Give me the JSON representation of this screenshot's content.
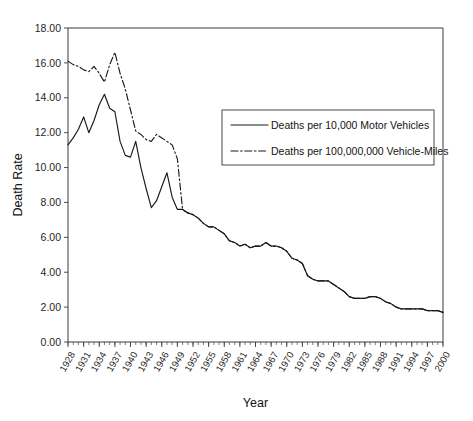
{
  "chart_data": {
    "type": "line",
    "title": "",
    "xlabel": "Year",
    "ylabel": "Death Rate",
    "ylim": [
      0,
      18
    ],
    "ytick_labels": [
      "0.00",
      "2.00",
      "4.00",
      "6.00",
      "8.00",
      "10.00",
      "12.00",
      "14.00",
      "16.00",
      "18.00"
    ],
    "ytick_values": [
      0,
      2,
      4,
      6,
      8,
      10,
      12,
      14,
      16,
      18
    ],
    "grid": false,
    "legend_position": "upper-right-inside",
    "xlim": [
      1928,
      2000
    ],
    "xtick_labels": [
      "1928",
      "1931",
      "1934",
      "1937",
      "1940",
      "1943",
      "1946",
      "1949",
      "1952",
      "1955",
      "1958",
      "1961",
      "1964",
      "1967",
      "1970",
      "1973",
      "1976",
      "1979",
      "1982",
      "1985",
      "1988",
      "1991",
      "1994",
      "1997",
      "2000"
    ],
    "xtick_values": [
      1928,
      1931,
      1934,
      1937,
      1940,
      1943,
      1946,
      1949,
      1952,
      1955,
      1958,
      1961,
      1964,
      1967,
      1970,
      1973,
      1976,
      1979,
      1982,
      1985,
      1988,
      1991,
      1994,
      1997,
      2000
    ],
    "x": [
      1928,
      1929,
      1930,
      1931,
      1932,
      1933,
      1934,
      1935,
      1936,
      1937,
      1938,
      1939,
      1940,
      1941,
      1942,
      1943,
      1944,
      1945,
      1946,
      1947,
      1948,
      1949,
      1950,
      1951,
      1952,
      1953,
      1954,
      1955,
      1956,
      1957,
      1958,
      1959,
      1960,
      1961,
      1962,
      1963,
      1964,
      1965,
      1966,
      1967,
      1968,
      1969,
      1970,
      1971,
      1972,
      1973,
      1974,
      1975,
      1976,
      1977,
      1978,
      1979,
      1980,
      1981,
      1982,
      1983,
      1984,
      1985,
      1986,
      1987,
      1988,
      1989,
      1990,
      1991,
      1992,
      1993,
      1994,
      1995,
      1996,
      1997,
      1998,
      1999,
      2000
    ],
    "series": [
      {
        "name": "Deaths per 10,000 Motor Vehicles",
        "style": "solid",
        "values": [
          11.3,
          11.7,
          12.2,
          12.9,
          12.0,
          12.7,
          13.6,
          14.2,
          13.4,
          13.2,
          11.5,
          10.7,
          10.6,
          11.5,
          10.0,
          8.8,
          7.7,
          8.1,
          8.9,
          9.7,
          8.3,
          7.6,
          7.6,
          7.4,
          7.3,
          7.1,
          6.8,
          6.6,
          6.6,
          6.4,
          6.2,
          5.8,
          5.7,
          5.5,
          5.6,
          5.4,
          5.5,
          5.5,
          5.7,
          5.5,
          5.5,
          5.4,
          5.2,
          4.8,
          4.7,
          4.5,
          3.8,
          3.6,
          3.5,
          3.5,
          3.5,
          3.3,
          3.1,
          2.9,
          2.6,
          2.5,
          2.5,
          2.5,
          2.6,
          2.6,
          2.5,
          2.3,
          2.2,
          2.0,
          1.9,
          1.9,
          1.9,
          1.9,
          1.9,
          1.8,
          1.8,
          1.8,
          1.7
        ]
      },
      {
        "name": "Deaths per 100,000,000 Vehicle-Miles",
        "style": "dashdot",
        "values": [
          16.1,
          15.9,
          15.8,
          15.6,
          15.5,
          15.8,
          15.4,
          14.9,
          15.9,
          16.6,
          15.4,
          14.5,
          13.3,
          12.1,
          11.9,
          11.6,
          11.5,
          11.9,
          11.7,
          11.5,
          11.3,
          10.5,
          7.6,
          7.4,
          7.3,
          7.1,
          6.8,
          6.6,
          6.6,
          6.4,
          6.2,
          5.8,
          5.7,
          5.5,
          5.6,
          5.4,
          5.5,
          5.5,
          5.7,
          5.5,
          5.5,
          5.4,
          5.2,
          4.8,
          4.7,
          4.5,
          3.8,
          3.6,
          3.5,
          3.5,
          3.5,
          3.3,
          3.1,
          2.9,
          2.6,
          2.5,
          2.5,
          2.5,
          2.6,
          2.6,
          2.5,
          2.3,
          2.2,
          2.0,
          1.9,
          1.9,
          1.9,
          1.9,
          1.9,
          1.8,
          1.8,
          1.8,
          1.7
        ]
      }
    ],
    "legend": [
      {
        "label": "Deaths per 10,000 Motor Vehicles",
        "style": "solid"
      },
      {
        "label": "Deaths per 100,000,000 Vehicle-Miles",
        "style": "dashdot"
      }
    ]
  }
}
